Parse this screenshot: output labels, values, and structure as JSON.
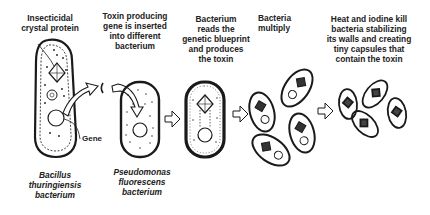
{
  "steps": [
    {
      "id": "step1",
      "caption": "Insecticidal\ncrystal protein"
    },
    {
      "id": "step2",
      "caption": "Toxin producing\ngene is inserted\ninto different\nbacterium"
    },
    {
      "id": "step3",
      "caption": "Bacterium\nreads the\ngenetic blueprint\nand produces\nthe toxin"
    },
    {
      "id": "step4",
      "caption": "Bacteria\nmultiply"
    },
    {
      "id": "step5",
      "caption": "Heat and iodine kill\nbacteria stabilizing\nits walls and creating\ntiny capsules that\ncontain the toxin"
    }
  ],
  "labels": {
    "gene": "Gene",
    "organism1": "Bacillus\nthuringiensis\nbacterium",
    "organism2": "Pseudomonas\nfluorescens\nbacterium"
  },
  "icons": [
    "cell-icon",
    "crystal-icon",
    "gene-circle-icon",
    "arrow-right-icon",
    "curved-arrow-icon",
    "capsule-icon"
  ],
  "colors": {
    "ink": "#1a1a1a",
    "background": "#ffffff"
  }
}
